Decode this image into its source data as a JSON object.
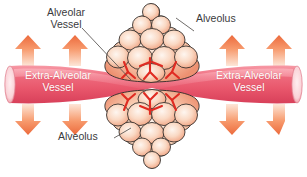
{
  "figure": {
    "width": 307,
    "height": 177,
    "background": "#ffffff"
  },
  "labels": {
    "alveolar_vessel": "Alveolar\nVessel",
    "alveolus_top": "Alveolus",
    "alveolus_bottom": "Alveolus",
    "extra_alveolar_vessel_left": "Extra-Alveolar\nVessel",
    "extra_alveolar_vessel_right": "Extra-Alveolar\nVessel",
    "caption": ""
  },
  "colors": {
    "vessel_red": "#e8576b",
    "vessel_red_light": "#f6929e",
    "vessel_red_dark": "#d23d55",
    "vessel_lumen": "#fbe4e6",
    "alveolus_fill_light": "#fdf0e8",
    "alveolus_fill_mid": "#f5b79a",
    "alveolus_fill_deep": "#ef9a78",
    "alveolus_outline": "#2e2a28",
    "capillary_red": "#e02b22",
    "arrow_top": "#ef7344",
    "arrow_bottom": "#fdded0",
    "label_text": "#3a3a3c",
    "label_text_on_vessel": "#ffffff"
  },
  "arrows": {
    "direction_up": "up",
    "direction_down": "down",
    "count_up": 4,
    "count_down": 4,
    "positions_up": [
      {
        "x": 28,
        "y": 40
      },
      {
        "x": 75,
        "y": 40
      },
      {
        "x": 232,
        "y": 40
      },
      {
        "x": 279,
        "y": 40
      }
    ],
    "positions_down": [
      {
        "x": 28,
        "y": 106
      },
      {
        "x": 75,
        "y": 106
      },
      {
        "x": 232,
        "y": 106
      },
      {
        "x": 279,
        "y": 106
      }
    ]
  },
  "structures": {
    "alveolus_top": {
      "name": "alveolus-upper-cluster",
      "lobes": 11
    },
    "alveolus_bottom": {
      "name": "alveolus-lower-cluster",
      "lobes": 11
    },
    "extra_alveolar_vessel": {
      "name": "extra-alveolar-vessel-tube",
      "shape": "pinched-waist-tube"
    }
  }
}
